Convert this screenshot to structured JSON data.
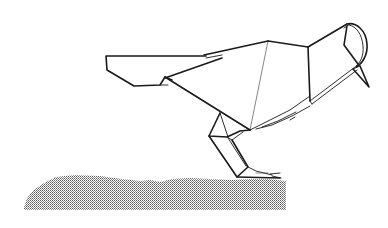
{
  "illustration": {
    "subject": "origami bird pecking at ground",
    "style": "black line drawing on white",
    "colors": {
      "background": "#ffffff",
      "line": "#1a1a1a",
      "ground_dots": "#6a6a6a"
    },
    "parts": [
      "tail",
      "back",
      "wing",
      "head",
      "beak",
      "legs",
      "feet",
      "ground"
    ]
  }
}
